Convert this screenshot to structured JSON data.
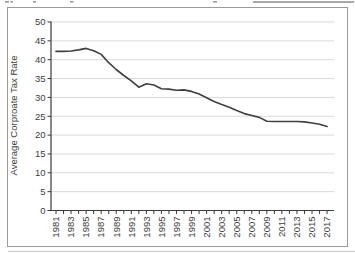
{
  "chart_data": {
    "type": "line",
    "title": "",
    "xlabel": "",
    "ylabel": "Average Corproate Tax Rate",
    "ylim": [
      0,
      50
    ],
    "ytick_step": 5,
    "xtick_label_every": 2,
    "grid": true,
    "legend": "none",
    "x": [
      1981,
      1982,
      1983,
      1984,
      1985,
      1986,
      1987,
      1988,
      1989,
      1990,
      1991,
      1992,
      1993,
      1994,
      1995,
      1996,
      1997,
      1998,
      1999,
      2000,
      2001,
      2002,
      2003,
      2004,
      2005,
      2006,
      2007,
      2008,
      2009,
      2010,
      2011,
      2012,
      2013,
      2014,
      2015,
      2016,
      2017
    ],
    "values": [
      42.2,
      42.2,
      42.3,
      42.6,
      43.0,
      42.4,
      41.4,
      39.2,
      37.4,
      35.8,
      34.4,
      32.7,
      33.6,
      33.3,
      32.3,
      32.2,
      31.9,
      32.0,
      31.6,
      30.9,
      29.9,
      28.9,
      28.1,
      27.4,
      26.5,
      25.7,
      25.2,
      24.7,
      23.7,
      23.6,
      23.6,
      23.6,
      23.6,
      23.5,
      23.2,
      22.9,
      22.3
    ],
    "colors": {
      "line": "#3f3f3f",
      "grid": "#d9d9d9",
      "axis": "#3a3a3a",
      "tick_label": "#3d3d3d",
      "frame_border": "#9a9a9a",
      "background": "#ffffff",
      "crop_artifact": "#9a9a9a"
    }
  }
}
